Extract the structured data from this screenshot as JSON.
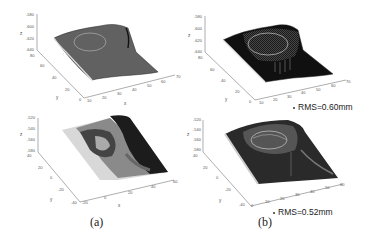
{
  "figure": {
    "captions": [
      "(a)",
      "(b)"
    ],
    "panels": [
      {
        "id": "a-top",
        "z_ticks": [
          "-580",
          "-600",
          "-620",
          "-640"
        ],
        "z_label": "z",
        "y_ticks": [
          "80",
          "60",
          "40",
          "20",
          "0"
        ],
        "y_label": "y",
        "x_ticks": [
          "10",
          "20",
          "30",
          "40",
          "50",
          "60",
          "70"
        ],
        "x_label": "x",
        "surface_style": "mesh"
      },
      {
        "id": "b-top",
        "z_ticks": [
          "-580",
          "-600",
          "-620",
          "-640"
        ],
        "z_label": "z",
        "y_ticks": [
          "80",
          "60",
          "40",
          "20",
          "0"
        ],
        "y_label": "y",
        "x_ticks": [
          "10",
          "20",
          "30",
          "40",
          "50",
          "60",
          "70"
        ],
        "x_label": "x",
        "annotation": "RMS=0.60mm",
        "surface_style": "dark-with-mesh"
      },
      {
        "id": "a-bottom",
        "z_ticks": [
          "-520",
          "-540",
          "-560",
          "-580"
        ],
        "z_label": "z",
        "y_ticks": [
          "40",
          "20",
          "0",
          "-20",
          "-40"
        ],
        "y_label": "y",
        "x_ticks": [
          "-20",
          "0",
          "20",
          "40",
          "60"
        ],
        "x_label": "x",
        "surface_style": "shaded"
      },
      {
        "id": "b-bottom",
        "z_ticks": [
          "-520",
          "-540",
          "-560",
          "-580"
        ],
        "z_label": "z",
        "y_ticks": [
          "40",
          "20",
          "0",
          "-20",
          "-40"
        ],
        "y_label": "y",
        "x_ticks": [
          "0",
          "10",
          "20",
          "30",
          "40",
          "50",
          "60"
        ],
        "x_label": "x",
        "annotation": "RMS=0.52mm",
        "surface_style": "dark-shaded"
      }
    ]
  }
}
